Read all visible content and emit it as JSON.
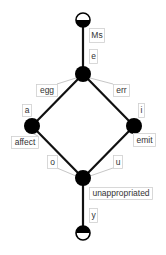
{
  "diagram": {
    "type": "lattice",
    "nodes": [
      {
        "id": "top",
        "kind": "terminal-top",
        "x": 83,
        "y": 20,
        "r": 7
      },
      {
        "id": "n_e",
        "kind": "junction",
        "x": 83,
        "y": 74,
        "r": 8
      },
      {
        "id": "n_a",
        "kind": "junction",
        "x": 32,
        "y": 126,
        "r": 8
      },
      {
        "id": "n_i",
        "kind": "junction",
        "x": 134,
        "y": 126,
        "r": 8
      },
      {
        "id": "n_bottom",
        "kind": "junction",
        "x": 83,
        "y": 178,
        "r": 8
      },
      {
        "id": "bottom",
        "kind": "terminal-bottom",
        "x": 83,
        "y": 233,
        "r": 7
      }
    ],
    "edges": [
      {
        "from": "top",
        "to": "n_e"
      },
      {
        "from": "n_e",
        "to": "n_a"
      },
      {
        "from": "n_e",
        "to": "n_i"
      },
      {
        "from": "n_a",
        "to": "n_bottom"
      },
      {
        "from": "n_i",
        "to": "n_bottom"
      },
      {
        "from": "n_bottom",
        "to": "bottom"
      }
    ],
    "labels": [
      {
        "text": "Ms",
        "x": 89,
        "y": 28,
        "w": 15,
        "h": 14
      },
      {
        "text": "e",
        "x": 89,
        "y": 49,
        "w": 8,
        "h": 14
      },
      {
        "text": "egg",
        "x": 36,
        "y": 84,
        "w": 21,
        "h": 12,
        "leader": [
          57,
          84,
          76,
          78
        ]
      },
      {
        "text": "err",
        "x": 113,
        "y": 84,
        "w": 16,
        "h": 12,
        "leader": [
          113,
          84,
          90,
          78
        ]
      },
      {
        "text": "a",
        "x": 22,
        "y": 104,
        "w": 9,
        "h": 12
      },
      {
        "text": "affect",
        "x": 11,
        "y": 136,
        "w": 27,
        "h": 12,
        "leader": [
          38,
          136,
          30,
          132
        ]
      },
      {
        "text": "i",
        "x": 138,
        "y": 103,
        "w": 6,
        "h": 14
      },
      {
        "text": "emit",
        "x": 133,
        "y": 133,
        "w": 22,
        "h": 13
      },
      {
        "text": "o",
        "x": 47,
        "y": 155,
        "w": 10,
        "h": 13,
        "leader": [
          57,
          168,
          76,
          176
        ]
      },
      {
        "text": "u",
        "x": 113,
        "y": 155,
        "w": 9,
        "h": 13,
        "leader": [
          113,
          168,
          90,
          176
        ]
      },
      {
        "text": "unappropriated",
        "x": 89,
        "y": 187,
        "w": 63,
        "h": 12
      },
      {
        "text": "y",
        "x": 89,
        "y": 208,
        "w": 8,
        "h": 14
      }
    ]
  }
}
